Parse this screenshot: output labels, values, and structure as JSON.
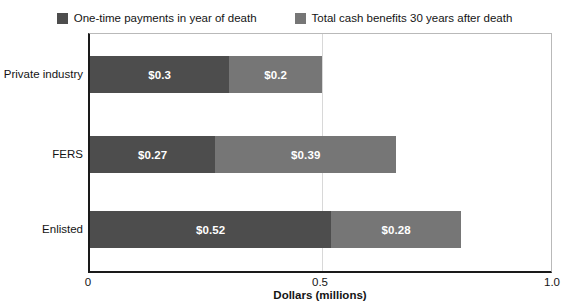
{
  "chart_data": {
    "type": "bar",
    "orientation": "horizontal",
    "stacked": true,
    "title": "",
    "xlabel": "Dollars (millions)",
    "ylabel": "",
    "xlim": [
      0,
      1.0
    ],
    "xticks": [
      "0",
      "0.5",
      "1.0"
    ],
    "xtick_values": [
      0,
      0.5,
      1.0
    ],
    "grid": true,
    "grid_axis": "x",
    "legend_position": "top",
    "categories": [
      "Private industry",
      "FERS",
      "Enlisted"
    ],
    "series": [
      {
        "name": "One-time payments in year of death",
        "color": "#4d4d4d",
        "values": [
          0.3,
          0.27,
          0.52
        ],
        "labels": [
          "$0.3",
          "$0.27",
          "$0.52"
        ]
      },
      {
        "name": "Total cash benefits 30 years after death",
        "color": "#767676",
        "values": [
          0.2,
          0.39,
          0.28
        ],
        "labels": [
          "$0.2",
          "$0.39",
          "$0.28"
        ]
      }
    ],
    "totals": [
      0.5,
      0.66,
      0.8
    ]
  },
  "legend": {
    "entries": [
      {
        "label": "One-time payments in year of death",
        "color": "#4d4d4d"
      },
      {
        "label": "Total cash benefits 30 years after death",
        "color": "#767676"
      }
    ]
  },
  "axis": {
    "x_title": "Dollars (millions)",
    "ticks": [
      "0",
      "0.5",
      "1.0"
    ]
  }
}
